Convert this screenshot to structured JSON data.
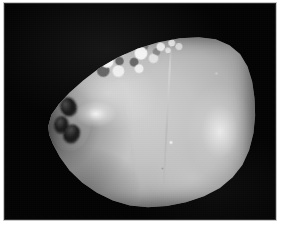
{
  "image": {
    "kind": "photograph",
    "subject": "coconut",
    "caption": "Dehusked coconut photographed against a black background",
    "orientation": "pointed end to the left, broad rounded end to the right",
    "color_mode": "grayscale",
    "width_px": 283,
    "height_px": 228
  },
  "frame": {
    "border_color": "#c9c9c9",
    "page_background": "#ffffff",
    "plate_background": "#040404"
  },
  "subject": {
    "label": "coconut",
    "body_color": "#c4c4c4",
    "shadow_color": "#7e7e7e",
    "highlight_color": "#ffffff",
    "features": [
      {
        "name": "germination-pore-top",
        "label": "Germination pore (eye) — upper"
      },
      {
        "name": "germination-pore-middle",
        "label": "Germination pore (eye) — middle"
      },
      {
        "name": "germination-pore-bottom",
        "label": "Germination pore (eye) — lower"
      },
      {
        "name": "husk-patch",
        "label": "Mottled husk residue patch"
      },
      {
        "name": "husk-patch-secondary",
        "label": "Secondary speckled husk patch"
      },
      {
        "name": "seam-main",
        "label": "Vertical seam ridge"
      },
      {
        "name": "seam-secondary",
        "label": "Secondary seam ridge"
      },
      {
        "name": "specular-highlight",
        "label": "Specular highlight"
      }
    ]
  }
}
